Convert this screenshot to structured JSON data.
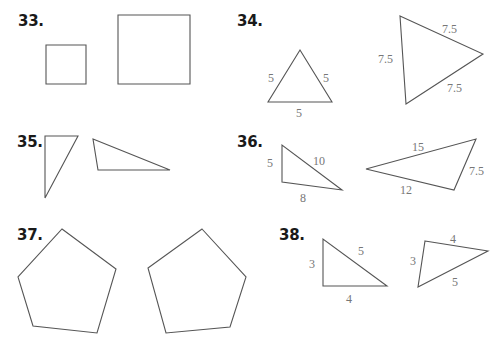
{
  "problems": [
    {
      "number": "33.",
      "labels": []
    },
    {
      "number": "34.",
      "labels": {
        "small": [
          "5",
          "5",
          "5"
        ],
        "large": [
          "7.5",
          "7.5",
          "7.5"
        ]
      }
    },
    {
      "number": "35.",
      "labels": []
    },
    {
      "number": "36.",
      "labels": {
        "small": [
          "5",
          "10",
          "8"
        ],
        "large": [
          "15",
          "7.5",
          "12"
        ]
      }
    },
    {
      "number": "37.",
      "labels": []
    },
    {
      "number": "38.",
      "labels": {
        "small": [
          "3",
          "5",
          "4"
        ],
        "large": [
          "4",
          "3",
          "5"
        ]
      }
    }
  ]
}
